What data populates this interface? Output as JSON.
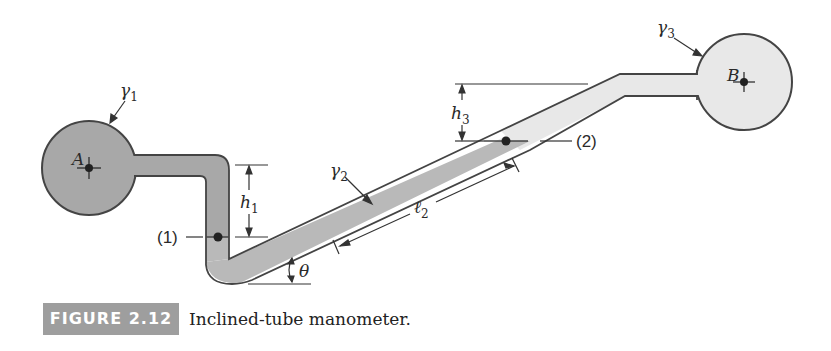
{
  "figure": {
    "badge": "FIGURE 2.12",
    "caption": "Inclined-tube manometer."
  },
  "labels": {
    "gamma1": "γ",
    "gamma1_sub": "1",
    "gamma2": "γ",
    "gamma2_sub": "2",
    "gamma3": "γ",
    "gamma3_sub": "3",
    "pointA": "A",
    "pointB": "B",
    "h1": "h",
    "h1_sub": "1",
    "h3": "h",
    "h3_sub": "3",
    "l2": "ℓ",
    "l2_sub": "2",
    "theta": "θ",
    "level1": "(1)",
    "level2": "(2)"
  },
  "colors": {
    "fluid_dark": "#a9a9a9",
    "fluid_mid": "#bcbcbc",
    "fluid_light": "#e6e6e6",
    "outline": "#444444"
  }
}
